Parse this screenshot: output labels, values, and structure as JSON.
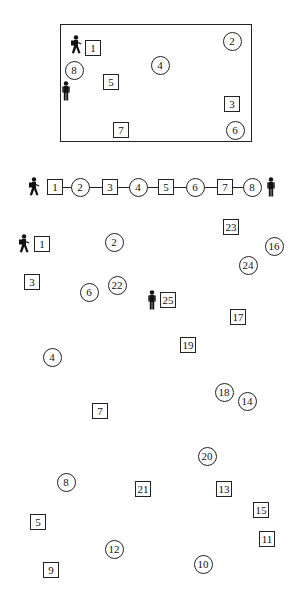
{
  "layout_diagram": {
    "nodes": [
      {
        "id": "1",
        "shape": "square",
        "x": 93,
        "y": 48
      },
      {
        "id": "2",
        "shape": "circle",
        "x": 232,
        "y": 41
      },
      {
        "id": "3",
        "shape": "square",
        "x": 232,
        "y": 104
      },
      {
        "id": "4",
        "shape": "circle",
        "x": 160,
        "y": 65
      },
      {
        "id": "5",
        "shape": "square",
        "x": 111,
        "y": 82
      },
      {
        "id": "6",
        "shape": "circle",
        "x": 235,
        "y": 130
      },
      {
        "id": "7",
        "shape": "square",
        "x": 121,
        "y": 130
      },
      {
        "id": "8",
        "shape": "circle",
        "x": 74,
        "y": 70
      }
    ],
    "start_figure": {
      "icon": "walking-person-icon",
      "x": 76,
      "y": 45
    },
    "end_figure": {
      "icon": "standing-person-icon",
      "x": 66,
      "y": 91
    }
  },
  "sequence": {
    "nodes": [
      {
        "id": "1",
        "shape": "square",
        "x": 55
      },
      {
        "id": "2",
        "shape": "circle",
        "x": 80
      },
      {
        "id": "3",
        "shape": "square",
        "x": 110
      },
      {
        "id": "4",
        "shape": "circle",
        "x": 138
      },
      {
        "id": "5",
        "shape": "square",
        "x": 166
      },
      {
        "id": "6",
        "shape": "circle",
        "x": 195
      },
      {
        "id": "7",
        "shape": "square",
        "x": 225
      },
      {
        "id": "8",
        "shape": "circle",
        "x": 252
      }
    ],
    "y": 187,
    "start_figure": {
      "icon": "walking-person-icon",
      "x": 34
    },
    "end_figure": {
      "icon": "standing-person-icon",
      "x": 271
    }
  },
  "scatter": {
    "nodes": [
      {
        "id": "1",
        "shape": "square",
        "x": 42,
        "y": 244
      },
      {
        "id": "2",
        "shape": "circle",
        "x": 114,
        "y": 242
      },
      {
        "id": "3",
        "shape": "square",
        "x": 32,
        "y": 282
      },
      {
        "id": "4",
        "shape": "circle",
        "x": 52,
        "y": 357
      },
      {
        "id": "5",
        "shape": "square",
        "x": 38,
        "y": 522
      },
      {
        "id": "6",
        "shape": "circle",
        "x": 89,
        "y": 292
      },
      {
        "id": "7",
        "shape": "square",
        "x": 100,
        "y": 411
      },
      {
        "id": "8",
        "shape": "circle",
        "x": 66,
        "y": 482
      },
      {
        "id": "9",
        "shape": "square",
        "x": 51,
        "y": 570
      },
      {
        "id": "10",
        "shape": "circle",
        "x": 203,
        "y": 564
      },
      {
        "id": "11",
        "shape": "square",
        "x": 267,
        "y": 539
      },
      {
        "id": "12",
        "shape": "circle",
        "x": 114,
        "y": 549
      },
      {
        "id": "13",
        "shape": "square",
        "x": 224,
        "y": 489
      },
      {
        "id": "14",
        "shape": "circle",
        "x": 247,
        "y": 401
      },
      {
        "id": "15",
        "shape": "square",
        "x": 261,
        "y": 510
      },
      {
        "id": "16",
        "shape": "circle",
        "x": 274,
        "y": 246
      },
      {
        "id": "17",
        "shape": "square",
        "x": 238,
        "y": 317
      },
      {
        "id": "18",
        "shape": "circle",
        "x": 224,
        "y": 392
      },
      {
        "id": "19",
        "shape": "square",
        "x": 188,
        "y": 345
      },
      {
        "id": "20",
        "shape": "circle",
        "x": 207,
        "y": 456
      },
      {
        "id": "21",
        "shape": "square",
        "x": 143,
        "y": 489
      },
      {
        "id": "22",
        "shape": "circle",
        "x": 117,
        "y": 285
      },
      {
        "id": "23",
        "shape": "square",
        "x": 231,
        "y": 227
      },
      {
        "id": "24",
        "shape": "circle",
        "x": 248,
        "y": 265
      },
      {
        "id": "25",
        "shape": "square",
        "x": 168,
        "y": 300
      }
    ],
    "start_figure": {
      "icon": "walking-person-icon",
      "x": 24,
      "y": 244
    },
    "end_figure": {
      "icon": "standing-person-icon",
      "x": 152,
      "y": 300
    }
  }
}
